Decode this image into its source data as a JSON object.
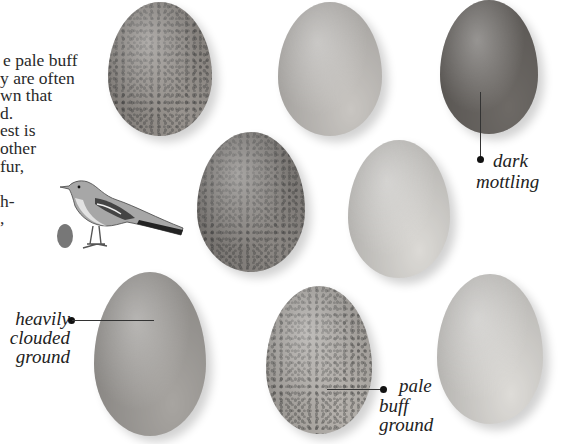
{
  "body_text": {
    "lines": [
      "e pale buff",
      "y are often",
      "wn that",
      "d.",
      "est is",
      "other",
      "fur,",
      "",
      "h-",
      ","
    ]
  },
  "eggs": [
    {
      "id": "egg-top-left",
      "description": "heavily speckled egg",
      "color": "#9a9590"
    },
    {
      "id": "egg-top-middle",
      "description": "pale lightly marked egg",
      "color": "#c9c6c2"
    },
    {
      "id": "egg-top-right",
      "description": "dark mottled egg",
      "color": "#6e6a66"
    },
    {
      "id": "egg-middle-left",
      "description": "finely speckled egg",
      "color": "#8c8884"
    },
    {
      "id": "egg-middle-right",
      "description": "plain pale egg",
      "color": "#dcdad6"
    },
    {
      "id": "egg-bottom-left",
      "description": "heavily clouded egg",
      "color": "#a8a5a1"
    },
    {
      "id": "egg-bottom-middle",
      "description": "pale buff speckled egg",
      "color": "#b7b3ae"
    },
    {
      "id": "egg-bottom-right",
      "description": "plain pale egg with few spots",
      "color": "#dedcd8"
    }
  ],
  "labels": {
    "dark_mottling": [
      "dark",
      "mottling"
    ],
    "heavily_clouded": [
      "heavily",
      "clouded",
      "ground"
    ],
    "pale_buff": [
      "pale",
      "buff",
      "ground"
    ]
  },
  "illustration": {
    "bird": "mockingbird illustration",
    "small_egg": "small egg scale reference"
  }
}
